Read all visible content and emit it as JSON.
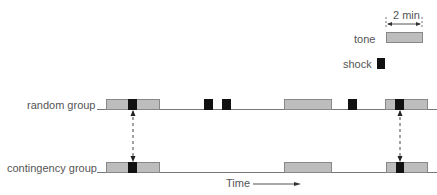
{
  "legend": {
    "scale_label": "2 min",
    "tone_label": "tone",
    "shock_label": "shock"
  },
  "rows": [
    {
      "label": "random group"
    },
    {
      "label": "contingency group"
    }
  ],
  "axis": {
    "time_label": "Time"
  },
  "colors": {
    "tone": "#bdbdbd",
    "shock": "#111111",
    "line": "#777777"
  }
}
